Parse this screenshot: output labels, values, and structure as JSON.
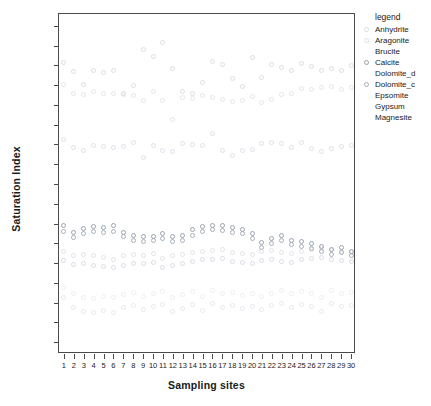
{
  "chart_data": {
    "type": "scatter",
    "title": "",
    "xlabel": "Sampling sites",
    "ylabel": "Saturation Index",
    "xlim": [
      0.5,
      30.5
    ],
    "ylim": [
      -4.3,
      4.3
    ],
    "grid": false,
    "legend_position": "right",
    "legend_title": "legend",
    "x_tick_labels": [
      "1",
      "2",
      "3",
      "4",
      "5",
      "6",
      "7",
      "8",
      "9",
      "10",
      "11",
      "12",
      "13",
      "14",
      "15",
      "16",
      "17",
      "18",
      "19",
      "20",
      "21",
      "22",
      "23",
      "24",
      "25",
      "26",
      "27",
      "28",
      "29",
      "30"
    ],
    "y_tick_labels": [
      "4.0",
      "3.5",
      "3.0",
      "2.5",
      "2.0",
      "1.5",
      "1.0",
      "0.5",
      "0.0",
      "-0.5",
      "-1.0",
      "-1.5",
      "-2.0",
      "-2.5",
      "-3.0",
      "-3.5",
      "-4.0"
    ],
    "y_tick_values": [
      4.0,
      3.5,
      3.0,
      2.5,
      2.0,
      1.5,
      1.0,
      0.5,
      0.0,
      -0.5,
      -1.0,
      -1.5,
      -2.0,
      -2.5,
      -3.0,
      -3.5,
      -4.0
    ],
    "x": [
      1,
      2,
      3,
      4,
      5,
      6,
      7,
      8,
      9,
      10,
      11,
      12,
      13,
      14,
      15,
      16,
      17,
      18,
      19,
      20,
      21,
      22,
      23,
      24,
      25,
      26,
      27,
      28,
      29,
      30
    ],
    "series": [
      {
        "name": "Anhydrite",
        "color": "#d8dce4",
        "values": [
          -1.93,
          -2.03,
          -2.0,
          -2.05,
          -2.08,
          -2.12,
          -2.05,
          -2.0,
          -2.02,
          -1.98,
          -2.1,
          -2.05,
          -2.0,
          -1.95,
          -1.92,
          -1.9,
          -1.88,
          -1.95,
          -1.98,
          -2.0,
          -1.93,
          -1.9,
          -1.95,
          -1.98,
          -1.92,
          -1.88,
          -1.85,
          -1.9,
          -1.93,
          -1.95
        ]
      },
      {
        "name": "Aragonite",
        "color": "#dde0e6",
        "values": [
          1.12,
          0.93,
          0.86,
          0.97,
          0.94,
          0.93,
          0.94,
          1.05,
          0.68,
          0.97,
          0.86,
          0.83,
          1.02,
          1.0,
          0.98,
          1.27,
          0.85,
          0.72,
          0.86,
          0.88,
          1.02,
          1.05,
          1.02,
          0.92,
          1.05,
          0.9,
          0.83,
          0.9,
          0.94,
          0.97
        ]
      },
      {
        "name": "Brucite",
        "color": "#e6e8ec",
        "values": [
          -2.88,
          -3.12,
          -3.22,
          -3.26,
          -3.2,
          -3.24,
          -3.12,
          -3.08,
          -3.18,
          -3.1,
          -3.05,
          -3.22,
          -3.15,
          -3.05,
          -3.2,
          -3.02,
          -3.12,
          -3.08,
          -3.16,
          -3.1,
          -3.18,
          -3.08,
          -3.02,
          -3.12,
          -3.05,
          -3.1,
          -3.22,
          -3.02,
          -3.1,
          -3.08
        ]
      },
      {
        "name": "Calcite",
        "color": "#9aa2b0",
        "values": [
          -1.05,
          -1.22,
          -1.12,
          -1.08,
          -1.1,
          -1.06,
          -1.22,
          -1.3,
          -1.33,
          -1.32,
          -1.26,
          -1.32,
          -1.3,
          -1.16,
          -1.08,
          -1.04,
          -1.06,
          -1.1,
          -1.14,
          -1.26,
          -1.48,
          -1.38,
          -1.3,
          -1.42,
          -1.46,
          -1.5,
          -1.58,
          -1.66,
          -1.6,
          -1.7
        ]
      },
      {
        "name": "Dolomite_d",
        "color": "#e4e6ea",
        "values": [
          2.52,
          2.3,
          2.26,
          2.34,
          2.28,
          2.3,
          2.26,
          2.24,
          2.1,
          2.34,
          2.12,
          1.64,
          2.18,
          2.16,
          2.24,
          2.2,
          2.14,
          2.08,
          2.12,
          2.22,
          2.06,
          2.14,
          2.26,
          2.3,
          2.42,
          2.4,
          2.44,
          2.46,
          2.38,
          2.44
        ]
      },
      {
        "name": "Dolomite_c",
        "color": "#a8b0bc",
        "values": [
          -1.2,
          -1.36,
          -1.26,
          -1.2,
          -1.22,
          -1.2,
          -1.34,
          -1.42,
          -1.46,
          -1.44,
          -1.38,
          -1.46,
          -1.42,
          -1.3,
          -1.2,
          -1.16,
          -1.18,
          -1.22,
          -1.26,
          -1.38,
          -1.6,
          -1.5,
          -1.44,
          -1.54,
          -1.58,
          -1.62,
          -1.7,
          -1.78,
          -1.72,
          -1.82
        ]
      },
      {
        "name": "Epsomite",
        "color": "#eceef1",
        "values": [
          -2.62,
          -2.78,
          -2.86,
          -2.9,
          -2.84,
          -2.88,
          -2.8,
          -2.74,
          -2.84,
          -2.78,
          -2.72,
          -2.86,
          -2.8,
          -2.72,
          -2.84,
          -2.7,
          -2.78,
          -2.74,
          -2.82,
          -2.76,
          -2.84,
          -2.76,
          -2.7,
          -2.78,
          -2.72,
          -2.76,
          -2.86,
          -2.7,
          -2.76,
          -2.74
        ]
      },
      {
        "name": "Gypsum",
        "color": "#e0e3e8",
        "values": [
          -1.7,
          -1.8,
          -1.78,
          -1.82,
          -1.86,
          -1.9,
          -1.82,
          -1.78,
          -1.8,
          -1.76,
          -1.88,
          -1.82,
          -1.78,
          -1.72,
          -1.7,
          -1.68,
          -1.66,
          -1.72,
          -1.76,
          -1.78,
          -1.7,
          -1.68,
          -1.72,
          -1.76,
          -1.7,
          -1.66,
          -1.62,
          -1.68,
          -1.7,
          -1.72
        ]
      },
      {
        "name": "Magnesite",
        "color": "#dadde3",
        "values": [
          3.08,
          2.84,
          2.52,
          2.86,
          2.82,
          2.88,
          2.3,
          2.5,
          3.39,
          3.22,
          3.58,
          2.92,
          2.34,
          2.28,
          2.56,
          3.1,
          3.02,
          2.68,
          2.46,
          3.2,
          2.7,
          3.02,
          2.94,
          2.88,
          3.04,
          2.96,
          2.86,
          2.92,
          2.88,
          3.0
        ]
      }
    ]
  },
  "legend": {
    "title": "legend",
    "items": [
      {
        "label": "Anhydrite",
        "color": "#d8dce4",
        "marker": "open-circle",
        "show_marker": true
      },
      {
        "label": "Aragonite",
        "color": "#dde0e6",
        "marker": "open-circle",
        "show_marker": true
      },
      {
        "label": "Brucite",
        "color": "#e6e8ec",
        "marker": "open-circle",
        "show_marker": false
      },
      {
        "label": "Calcite",
        "color": "#9aa2b0",
        "marker": "open-circle",
        "show_marker": true
      },
      {
        "label": "Dolomite_d",
        "color": "#e4e6ea",
        "marker": "open-circle",
        "show_marker": false
      },
      {
        "label": "Dolomite_c",
        "color": "#a8b0bc",
        "marker": "open-circle",
        "show_marker": true
      },
      {
        "label": "Epsomite",
        "color": "#eceef1",
        "marker": "open-circle",
        "show_marker": false
      },
      {
        "label": "Gypsum",
        "color": "#e0e3e8",
        "marker": "open-circle",
        "show_marker": false
      },
      {
        "label": "Magnesite",
        "color": "#dadde3",
        "marker": "open-circle",
        "show_marker": false
      }
    ]
  },
  "axes": {
    "y_title": "Saturation Index",
    "x_title": "Sampling sites",
    "frame_color": "#4a4a4a"
  }
}
